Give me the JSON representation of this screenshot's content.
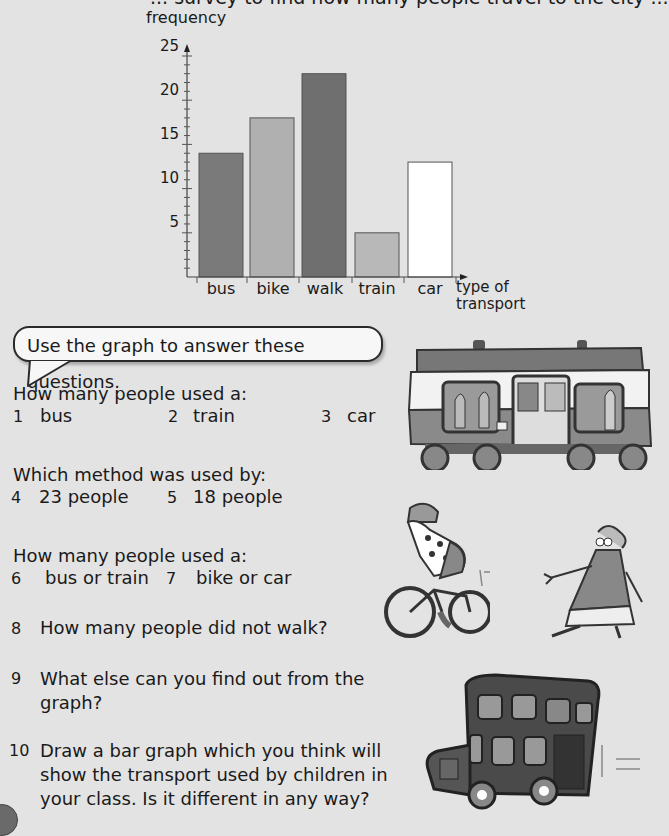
{
  "page": {
    "cut_off_heading": "... survey to find how many people travel to the city ..."
  },
  "chart_data": {
    "type": "bar",
    "title": "",
    "xlabel": "type of transport",
    "ylabel": "frequency",
    "categories": [
      "bus",
      "bike",
      "walk",
      "train",
      "car"
    ],
    "values": [
      14,
      18,
      23,
      5,
      13
    ],
    "bar_colors": [
      "#7a7a7a",
      "#b0b0b0",
      "#6f6f6f",
      "#b8b8b8",
      "#ffffff"
    ],
    "yticks": [
      5,
      10,
      15,
      20,
      25
    ],
    "ytick_labels": [
      "5",
      "10",
      "15",
      "20",
      "25"
    ],
    "ylim": [
      0,
      25
    ],
    "minor_tick_step": 1,
    "grid": false,
    "legend": "none"
  },
  "chart": {
    "ylabel": "frequency",
    "xlabel_line1": "type of",
    "xlabel_line2": "transport",
    "yticks": [
      "5",
      "10",
      "15",
      "20",
      "25"
    ],
    "xticks": [
      "bus",
      "bike",
      "walk",
      "train",
      "car"
    ]
  },
  "speech_bubble": {
    "text": "Use the graph to answer these questions."
  },
  "questions": {
    "group1_prompt": "How many people used a:",
    "q1_num": "1",
    "q1_text": "bus",
    "q2_num": "2",
    "q2_text": "train",
    "q3_num": "3",
    "q3_text": "car",
    "group2_prompt": "Which method was used by:",
    "q4_num": "4",
    "q4_text": "23 people",
    "q5_num": "5",
    "q5_text": "18 people",
    "group3_prompt": "How many people used a:",
    "q6_num": "6",
    "q6_text": "bus or train",
    "q7_num": "7",
    "q7_text": "bike or car",
    "q8_num": "8",
    "q8_text": "How many people did not walk?",
    "q9_num": "9",
    "q9_line1": "What else can you find out from the",
    "q9_line2": "graph?",
    "q10_num": "10",
    "q10_line1": "Draw a bar graph which you think will",
    "q10_line2": "show the transport used by children in",
    "q10_line3": "your class. Is it different in any way?"
  },
  "illustrations": [
    "train-illustration",
    "cyclist-illustration",
    "walking-woman-illustration",
    "double-decker-bus-illustration"
  ]
}
